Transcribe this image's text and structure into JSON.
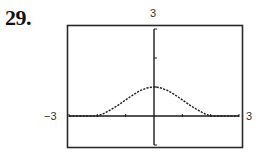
{
  "problem": {
    "number": "29."
  },
  "chart_data": {
    "type": "line",
    "title": "",
    "xlabel": "",
    "ylabel": "",
    "window": {
      "xmin": -3,
      "xmax": 3,
      "xscale": 1,
      "ymin": -1,
      "ymax": 3,
      "yscale": 1
    },
    "xlim": [
      -3,
      3
    ],
    "ylim": [
      -1,
      3
    ],
    "tick_labels": {
      "x_left": "−3",
      "x_right": "3",
      "y_top": "3"
    },
    "grid": false,
    "legend": null,
    "series": [
      {
        "name": "f(x)",
        "style": "dotted",
        "x": [
          -3,
          -2.5,
          -2,
          -1.5,
          -1.25,
          -1,
          -0.75,
          -0.5,
          -0.25,
          0,
          0.25,
          0.5,
          0.75,
          1,
          1.25,
          1.5,
          2,
          2.5,
          3
        ],
        "values": [
          0.0,
          0.0,
          0.0,
          0.32,
          0.46,
          0.61,
          0.75,
          0.88,
          0.97,
          1.0,
          0.97,
          0.88,
          0.75,
          0.61,
          0.46,
          0.32,
          0.0,
          0.0,
          0.0
        ]
      }
    ],
    "annotations": [
      "Curve peaks at (0, 1)",
      "Curve approaches the x-axis near x = ±2"
    ]
  },
  "colors": {
    "frame": "#2a2a2a",
    "axes": "#1a1a1a",
    "curve": "#222222",
    "text": "#333333"
  }
}
